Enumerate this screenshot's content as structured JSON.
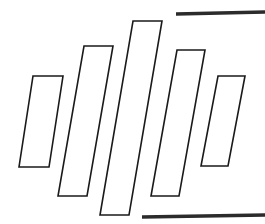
{
  "figure": {
    "background_color": "#ffffff",
    "stroke_color": "#1a1a1a",
    "rule_color": "#2b2b2b",
    "width": 265,
    "height": 224
  },
  "chart_data": {
    "type": "bar",
    "xlabel": "",
    "ylabel": "",
    "grid": false,
    "legend": null,
    "categories": [
      "1",
      "2",
      "3",
      "4",
      "5",
      "6"
    ],
    "values": [
      91,
      150,
      194,
      146,
      90,
      0
    ],
    "ylim": [
      0,
      224
    ],
    "style": {
      "fill": "none",
      "outline_only": true,
      "skew_degrees": -10,
      "bar_width_px": 29
    },
    "bars": [
      {
        "index": 0,
        "label": "1",
        "value": 91,
        "top_left_x": 33,
        "top_y": 76,
        "bottom_left_x": 19,
        "bottom_y": 167,
        "width": 30
      },
      {
        "index": 1,
        "label": "2",
        "value": 150,
        "top_left_x": 84,
        "top_y": 46,
        "bottom_left_x": 58,
        "bottom_y": 196,
        "width": 29
      },
      {
        "index": 2,
        "label": "3",
        "value": 194,
        "top_left_x": 133,
        "top_y": 21,
        "bottom_left_x": 100,
        "bottom_y": 215,
        "width": 29
      },
      {
        "index": 3,
        "label": "4",
        "value": 146,
        "top_left_x": 177,
        "top_y": 50,
        "bottom_left_x": 151,
        "bottom_y": 196,
        "width": 28
      },
      {
        "index": 4,
        "label": "5",
        "value": 90,
        "top_left_x": 218,
        "top_y": 76,
        "bottom_left_x": 201,
        "bottom_y": 166,
        "width": 27
      }
    ],
    "annotations": [
      {
        "name": "top-rule",
        "x1": 176,
        "y1": 14,
        "x2": 265,
        "y2": 12
      },
      {
        "name": "bottom-rule",
        "x1": 142,
        "y1": 217,
        "x2": 265,
        "y2": 215
      }
    ]
  }
}
